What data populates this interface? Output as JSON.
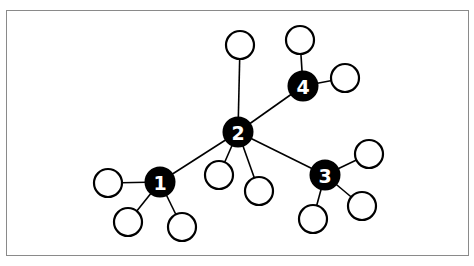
{
  "diagram": {
    "type": "network-graph",
    "hubs": [
      {
        "id": "1",
        "label": "1",
        "x": 160,
        "y": 182
      },
      {
        "id": "2",
        "label": "2",
        "x": 238,
        "y": 132
      },
      {
        "id": "3",
        "label": "3",
        "x": 325,
        "y": 175
      },
      {
        "id": "4",
        "label": "4",
        "x": 303,
        "y": 86
      }
    ],
    "leaves": [
      {
        "parent": "1",
        "x": 108,
        "y": 183
      },
      {
        "parent": "1",
        "x": 128,
        "y": 222
      },
      {
        "parent": "1",
        "x": 182,
        "y": 227
      },
      {
        "parent": "2",
        "x": 240,
        "y": 45
      },
      {
        "parent": "2",
        "x": 219,
        "y": 175
      },
      {
        "parent": "2",
        "x": 259,
        "y": 191
      },
      {
        "parent": "3",
        "x": 369,
        "y": 154
      },
      {
        "parent": "3",
        "x": 362,
        "y": 206
      },
      {
        "parent": "3",
        "x": 313,
        "y": 219
      },
      {
        "parent": "4",
        "x": 300,
        "y": 40
      },
      {
        "parent": "4",
        "x": 345,
        "y": 78
      }
    ],
    "hub_edges": [
      [
        "1",
        "2"
      ],
      [
        "2",
        "3"
      ],
      [
        "2",
        "4"
      ]
    ],
    "colors": {
      "hub_fill": "#000000",
      "leaf_fill": "#ffffff",
      "stroke": "#000000",
      "frame": "#8a8a8a"
    }
  }
}
